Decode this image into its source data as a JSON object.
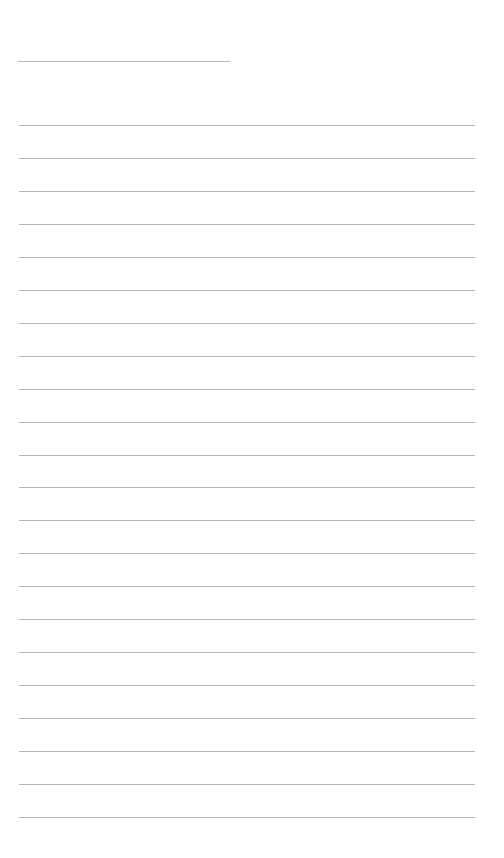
{
  "document": {
    "type": "lined-paper",
    "header_line": {
      "label": ""
    },
    "line_count": 22,
    "first_line_y": 125,
    "line_spacing": 32.95,
    "line_color": "#b4b4b4",
    "background_color": "#ffffff"
  }
}
